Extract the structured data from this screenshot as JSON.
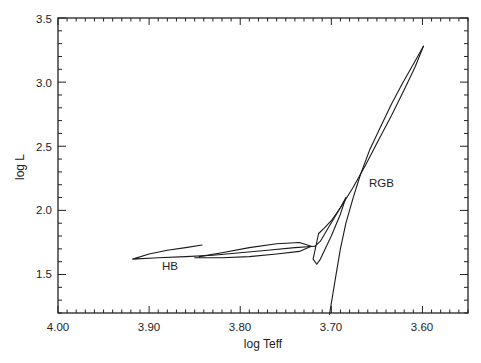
{
  "chart_data": {
    "type": "line",
    "title": "",
    "xlabel": "log Teff",
    "ylabel": "log L",
    "xlim": [
      4.0,
      3.55
    ],
    "ylim": [
      1.2,
      3.5
    ],
    "x_inverted": true,
    "grid": false,
    "legend": null,
    "xticks": [
      4.0,
      3.9,
      3.8,
      3.7,
      3.6
    ],
    "xtick_labels": [
      "4.00",
      "3.90",
      "3.80",
      "3.70",
      "3.60"
    ],
    "yticks": [
      1.5,
      2.0,
      2.5,
      3.0,
      3.5
    ],
    "ytick_labels": [
      "1.5",
      "2.0",
      "2.5",
      "3.0",
      "3.5"
    ],
    "annotations": [
      {
        "text": "HB",
        "x": 3.885,
        "y": 1.56
      },
      {
        "text": "RGB",
        "x": 3.655,
        "y": 2.05
      }
    ],
    "series": [
      {
        "name": "RGB",
        "description": "Red giant branch ascent",
        "x": [
          3.702,
          3.696,
          3.69,
          3.684,
          3.676,
          3.668,
          3.658,
          3.646,
          3.634,
          3.622,
          3.61,
          3.602,
          3.599
        ],
        "y": [
          1.19,
          1.45,
          1.7,
          1.9,
          2.1,
          2.28,
          2.47,
          2.65,
          2.83,
          2.99,
          3.14,
          3.24,
          3.28
        ]
      },
      {
        "name": "Post-flash descent",
        "description": "Return from RGB tip down toward ZAHB",
        "x": [
          3.599,
          3.608,
          3.62,
          3.634,
          3.648,
          3.662,
          3.676,
          3.69,
          3.7,
          3.708,
          3.714
        ],
        "y": [
          3.28,
          3.12,
          2.94,
          2.74,
          2.55,
          2.36,
          2.18,
          2.02,
          1.92,
          1.86,
          1.82
        ]
      },
      {
        "name": "Sub-flash loops",
        "description": "Secondary helium flash loops near RGB base",
        "x": [
          3.714,
          3.72,
          3.716,
          3.712,
          3.7,
          3.69,
          3.684,
          3.69,
          3.702,
          3.712,
          3.718
        ],
        "y": [
          1.82,
          1.62,
          1.58,
          1.62,
          1.8,
          1.97,
          2.1,
          2.02,
          1.88,
          1.76,
          1.72
        ]
      },
      {
        "name": "HB",
        "description": "Horizontal branch blueward excursion and return",
        "x": [
          3.718,
          3.74,
          3.77,
          3.8,
          3.83,
          3.86,
          3.89,
          3.918,
          3.9,
          3.88,
          3.86,
          3.842
        ],
        "y": [
          1.72,
          1.71,
          1.69,
          1.67,
          1.65,
          1.64,
          1.63,
          1.62,
          1.66,
          1.69,
          1.71,
          1.73
        ]
      },
      {
        "name": "HB lower loop",
        "description": "Lower blue loop between log Teff 3.85 and 3.72",
        "x": [
          3.85,
          3.82,
          3.79,
          3.76,
          3.735,
          3.722,
          3.735,
          3.76,
          3.79,
          3.82,
          3.845
        ],
        "y": [
          1.63,
          1.63,
          1.64,
          1.66,
          1.68,
          1.72,
          1.75,
          1.74,
          1.71,
          1.67,
          1.64
        ]
      }
    ]
  },
  "axes": {
    "xlabel": "log Teff",
    "ylabel": "log L",
    "xtick_labels": [
      "4.00",
      "3.90",
      "3.80",
      "3.70",
      "3.60"
    ],
    "ytick_labels": [
      "1.5",
      "2.0",
      "2.5",
      "3.0",
      "3.5"
    ]
  },
  "labels": {
    "hb": "HB",
    "rgb": "RGB"
  },
  "colors": {
    "line": "#1a1a1a",
    "frame": "#222222",
    "background": "#ffffff"
  }
}
